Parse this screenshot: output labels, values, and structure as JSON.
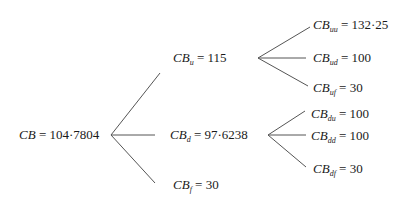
{
  "tree": {
    "root": {
      "var": "CB",
      "sub": "",
      "value": "104·7804"
    },
    "level1": [
      {
        "var": "CB",
        "sub": "u",
        "value": "115"
      },
      {
        "var": "CB",
        "sub": "d",
        "value": "97·6238"
      },
      {
        "var": "CB",
        "sub": "f",
        "value": "30"
      }
    ],
    "level2_up": [
      {
        "var": "CB",
        "sub": "uu",
        "value": "132·25"
      },
      {
        "var": "CB",
        "sub": "ud",
        "value": "100"
      },
      {
        "var": "CB",
        "sub": "uf",
        "value": "30"
      }
    ],
    "level2_down": [
      {
        "var": "CB",
        "sub": "du",
        "value": "100"
      },
      {
        "var": "CB",
        "sub": "dd",
        "value": "100"
      },
      {
        "var": "CB",
        "sub": "df",
        "value": "30"
      }
    ],
    "equals": "=",
    "line_color": "#555555"
  }
}
